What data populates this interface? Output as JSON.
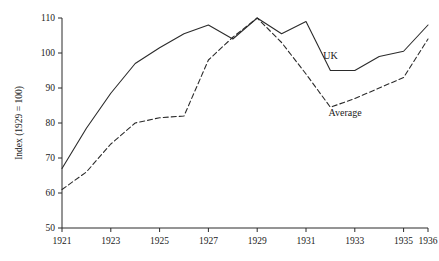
{
  "chart_data": {
    "type": "line",
    "title": "",
    "subtitle": "",
    "xlabel": "",
    "ylabel": "Index (1929 = 100)",
    "xlim": [
      1921,
      1936
    ],
    "ylim": [
      50,
      110
    ],
    "grid": false,
    "legend_position": "inline-annotation",
    "x": [
      1921,
      1922,
      1923,
      1924,
      1925,
      1926,
      1927,
      1928,
      1929,
      1930,
      1931,
      1932,
      1933,
      1934,
      1935,
      1936
    ],
    "xticks": [
      1921,
      1923,
      1925,
      1927,
      1929,
      1931,
      1933,
      1935,
      1936
    ],
    "xticklabels": [
      "1921",
      "1923",
      "1925",
      "1927",
      "1929",
      "1931",
      "1933",
      "1935",
      "1936"
    ],
    "yticks": [
      50,
      60,
      70,
      80,
      90,
      100,
      110
    ],
    "yticklabels": [
      "50",
      "60",
      "70",
      "80",
      "90",
      "100",
      "110"
    ],
    "series": [
      {
        "name": "UK",
        "style": "solid",
        "color": "#2b2b2b",
        "annotation": "UK",
        "values": [
          67.0,
          78.5,
          88.5,
          97.0,
          101.5,
          105.5,
          108.0,
          104.0,
          110.0,
          105.5,
          109.0,
          95.0,
          95.0,
          99.0,
          100.5,
          108.0
        ]
      },
      {
        "name": "Average",
        "style": "dashed",
        "color": "#2b2b2b",
        "annotation": "Average",
        "values": [
          61.0,
          66.0,
          74.0,
          80.0,
          81.5,
          82.0,
          98.0,
          104.5,
          110.0,
          103.0,
          94.0,
          84.5,
          87.0,
          90.0,
          93.0,
          104.0
        ]
      }
    ],
    "annotations": [
      {
        "text": "UK",
        "x": 1932.0,
        "y": 98.2
      },
      {
        "text": "Average",
        "x": 1932.6,
        "y": 82.0
      }
    ]
  }
}
